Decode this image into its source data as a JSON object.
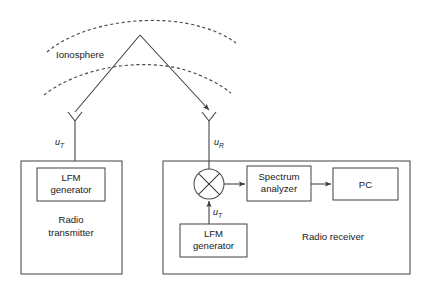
{
  "figure": {
    "type": "block-diagram",
    "background_color": "#ffffff",
    "line_color": "#3c3c3c",
    "text_color": "#1a1a1a"
  },
  "ionosphere": {
    "label": "Ionosphere",
    "layer_count": 2,
    "layer_style": "dashed-arc"
  },
  "propagation": {
    "path_description": "single-hop skywave reflection",
    "uplink_label": "u",
    "uplink_sub": "T",
    "downlink_label": "u",
    "downlink_sub": "R"
  },
  "transmitter": {
    "name": "radio-transmitter",
    "region_label_line1": "Radio",
    "region_label_line2": "transmitter",
    "blocks": [
      {
        "id": "tx-lfm-generator",
        "line1": "LFM",
        "line2": "generator"
      }
    ],
    "antenna_signal": {
      "label": "u",
      "sub": "T"
    }
  },
  "receiver": {
    "name": "radio-receiver",
    "region_label": "Radio receiver",
    "blocks": [
      {
        "id": "spectrum-analyzer",
        "line1": "Spectrum",
        "line2": "analyzer"
      },
      {
        "id": "pc",
        "line1": "PC",
        "line2": ""
      },
      {
        "id": "rx-lfm-generator",
        "line1": "LFM",
        "line2": "generator"
      }
    ],
    "mixer": {
      "id": "mixer",
      "symbol": "multiplier-cross-in-circle"
    },
    "antenna_signal": {
      "label": "u",
      "sub": "R"
    },
    "local_oscillator_signal": {
      "label": "u",
      "sub": "T"
    }
  }
}
